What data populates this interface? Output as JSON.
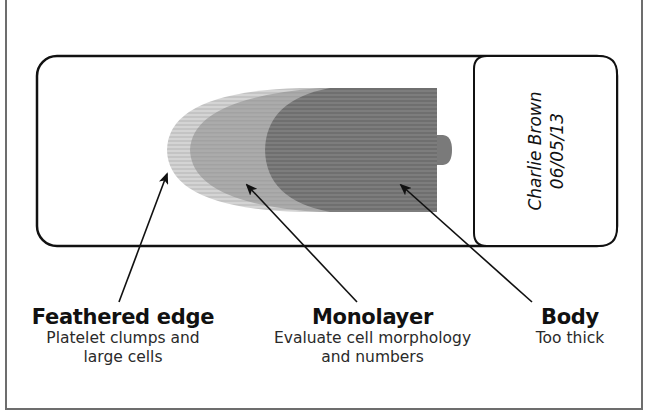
{
  "diagram": {
    "type": "blood-smear-slide",
    "slide_label": {
      "name": "Charlie Brown",
      "date": "06/05/13"
    },
    "regions": [
      {
        "id": "feathered-edge",
        "title": "Feathered edge",
        "description_line1": "Platelet clumps and",
        "description_line2": "large cells",
        "shade": "#cfcfcf"
      },
      {
        "id": "monolayer",
        "title": "Monolayer",
        "description_line1": "Evaluate cell morphology",
        "description_line2": "and numbers",
        "shade": "#a9a9a9"
      },
      {
        "id": "body",
        "title": "Body",
        "description_line1": "Too thick",
        "description_line2": "",
        "shade": "#7a7a7a"
      }
    ],
    "colors": {
      "outline": "#111111",
      "frame": "#6d6d6d",
      "arrow": "#111111"
    },
    "cutoff_caption": "..."
  }
}
